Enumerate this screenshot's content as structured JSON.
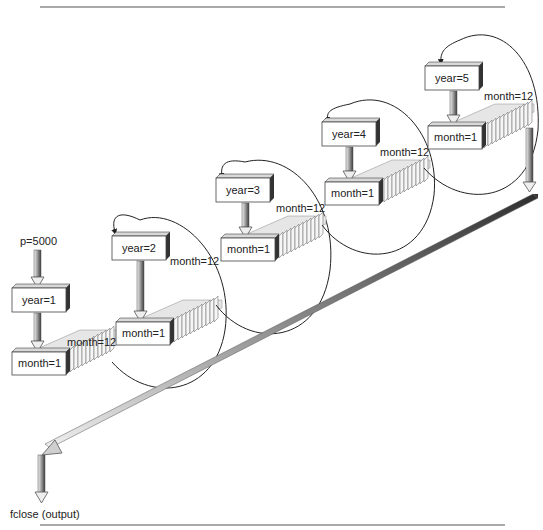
{
  "diagram": {
    "start_label": "p=5000",
    "end_label": "fclose (output)",
    "years": [
      {
        "year_label": "year=1",
        "first_month": "month=1",
        "last_month": "month=12"
      },
      {
        "year_label": "year=2",
        "first_month": "month=1",
        "last_month": "month=12"
      },
      {
        "year_label": "year=3",
        "first_month": "month=1",
        "last_month": "month=12"
      },
      {
        "year_label": "year=4",
        "first_month": "month=1",
        "last_month": "month=12"
      },
      {
        "year_label": "year=5",
        "first_month": "month=1",
        "last_month": "month=12"
      }
    ],
    "colors": {
      "box_fill": "#ffffff",
      "box_side": "#3a3a3a",
      "box_top": "#d8d8d8",
      "arrow_dark": "#555555",
      "arrow_light": "#e8e8e8",
      "line": "#222222"
    }
  }
}
